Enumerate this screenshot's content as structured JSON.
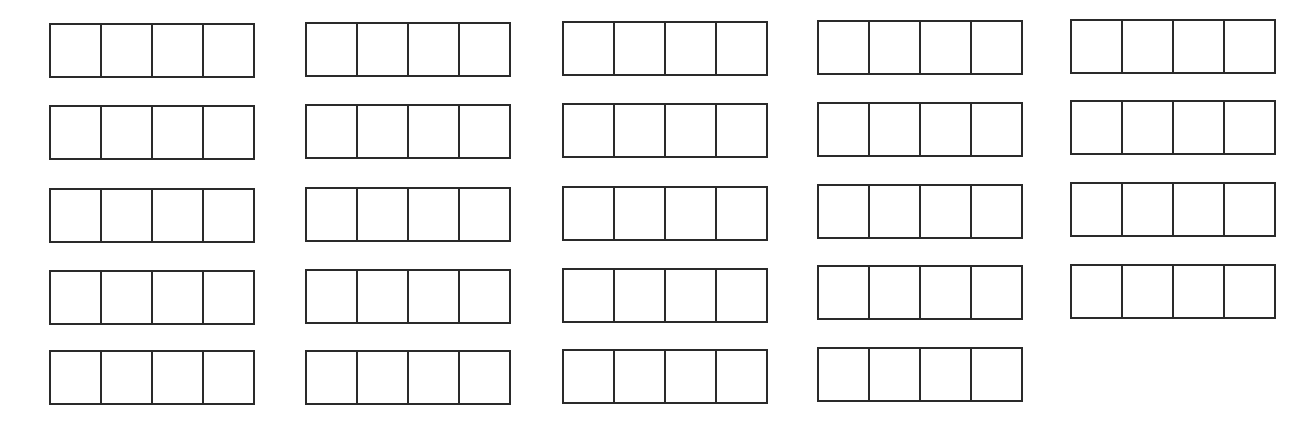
{
  "worksheet": {
    "columns": [
      {
        "x": 49,
        "rows": [
          23,
          105,
          188,
          270,
          350
        ]
      },
      {
        "x": 305,
        "rows": [
          22,
          104,
          187,
          269,
          350
        ]
      },
      {
        "x": 562,
        "rows": [
          21,
          103,
          186,
          268,
          349
        ]
      },
      {
        "x": 817,
        "rows": [
          20,
          102,
          184,
          265,
          347
        ]
      },
      {
        "x": 1070,
        "rows": [
          19,
          100,
          182,
          264
        ]
      }
    ],
    "boxes_per_group": 4,
    "group_width": 206,
    "line_color": "#2a2a2a",
    "cell_values": []
  }
}
